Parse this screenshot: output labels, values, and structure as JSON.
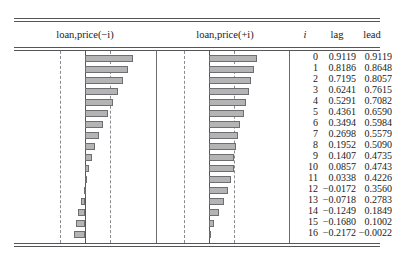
{
  "chart_data": {
    "type": "bar",
    "title": "",
    "panels": [
      {
        "name": "lag-panel",
        "header": "loan,price(−i)",
        "series_name": "lag",
        "orientation": "horizontal",
        "direction": "right-positive",
        "xlim": [
          -1,
          1
        ],
        "zero_at": 0,
        "confidence_bounds": [
          -0.48,
          0.48
        ]
      },
      {
        "name": "lead-panel",
        "header": "loan,price(+i)",
        "series_name": "lead",
        "orientation": "horizontal",
        "direction": "right-positive",
        "xlim": [
          -1,
          1
        ],
        "zero_at": 0,
        "confidence_bounds": [
          -0.48,
          0.48
        ]
      }
    ],
    "columns": [
      "i",
      "lag",
      "lead"
    ],
    "categories": [
      0,
      1,
      2,
      3,
      4,
      5,
      6,
      7,
      8,
      9,
      10,
      11,
      12,
      13,
      14,
      15,
      16
    ],
    "series": [
      {
        "name": "lag",
        "values": [
          0.9119,
          0.8186,
          0.7195,
          0.6241,
          0.5291,
          0.4361,
          0.3494,
          0.2698,
          0.1952,
          0.1407,
          0.0857,
          0.0338,
          -0.0172,
          -0.0718,
          -0.1249,
          -0.168,
          -0.2172
        ]
      },
      {
        "name": "lead",
        "values": [
          0.9119,
          0.8648,
          0.8057,
          0.7615,
          0.7082,
          0.659,
          0.5984,
          0.5579,
          0.509,
          0.4735,
          0.4743,
          0.4226,
          0.356,
          0.2783,
          0.1849,
          0.1002,
          -0.0022
        ]
      }
    ],
    "grid": false,
    "legend": "none",
    "xlabel": "",
    "ylabel": ""
  },
  "table": {
    "headers": {
      "lag_panel": "loan,price(−i)",
      "lead_panel": "loan,price(+i)",
      "index": "i",
      "lag": "lag",
      "lead": "lead"
    },
    "rows": [
      {
        "i": "0",
        "lag": "0.9119",
        "lead": "0.9119"
      },
      {
        "i": "1",
        "lag": "0.8186",
        "lead": "0.8648"
      },
      {
        "i": "2",
        "lag": "0.7195",
        "lead": "0.8057"
      },
      {
        "i": "3",
        "lag": "0.6241",
        "lead": "0.7615"
      },
      {
        "i": "4",
        "lag": "0.5291",
        "lead": "0.7082"
      },
      {
        "i": "5",
        "lag": "0.4361",
        "lead": "0.6590"
      },
      {
        "i": "6",
        "lag": "0.3494",
        "lead": "0.5984"
      },
      {
        "i": "7",
        "lag": "0.2698",
        "lead": "0.5579"
      },
      {
        "i": "8",
        "lag": "0.1952",
        "lead": "0.5090"
      },
      {
        "i": "9",
        "lag": "0.1407",
        "lead": "0.4735"
      },
      {
        "i": "10",
        "lag": "0.0857",
        "lead": "0.4743"
      },
      {
        "i": "11",
        "lag": "0.0338",
        "lead": "0.4226"
      },
      {
        "i": "12",
        "lag": "−0.0172",
        "lead": "0.3560"
      },
      {
        "i": "13",
        "lag": "−0.0718",
        "lead": "0.2783"
      },
      {
        "i": "14",
        "lag": "−0.1249",
        "lead": "0.1849"
      },
      {
        "i": "15",
        "lag": "−0.1680",
        "lead": "0.1002"
      },
      {
        "i": "16",
        "lag": "−0.2172",
        "lead": "−0.0022"
      }
    ]
  },
  "style": {
    "bar_fill": "#b4b4b4",
    "bar_stroke": "#6e6e72",
    "rule_color": "#55555a",
    "dashed_color": "#8a8a8f",
    "background": "#ffffff"
  }
}
